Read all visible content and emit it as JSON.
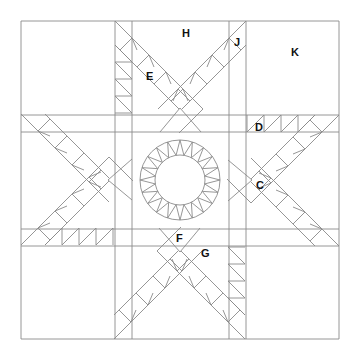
{
  "diagram": {
    "type": "quilt-block-pattern",
    "line_color": "#8a8a8a",
    "background": "#ffffff",
    "outer_square": {
      "x": 21,
      "y": 21,
      "size": 318
    },
    "center_square": {
      "x": 132,
      "y": 132,
      "size": 97
    },
    "center_ring": {
      "cx": 180,
      "cy": 180,
      "r_outer": 40,
      "r_inner": 25,
      "segments": 20
    },
    "labels": [
      {
        "id": "H",
        "text": "H",
        "x": 182,
        "y": 28
      },
      {
        "id": "J",
        "text": "J",
        "x": 234,
        "y": 37
      },
      {
        "id": "K",
        "text": "K",
        "x": 291,
        "y": 47
      },
      {
        "id": "E",
        "text": "E",
        "x": 146,
        "y": 71
      },
      {
        "id": "D",
        "text": "D",
        "x": 255,
        "y": 122
      },
      {
        "id": "C",
        "text": "C",
        "x": 256,
        "y": 180
      },
      {
        "id": "F",
        "text": "F",
        "x": 176,
        "y": 233
      },
      {
        "id": "G",
        "text": "G",
        "x": 201,
        "y": 248
      }
    ]
  }
}
